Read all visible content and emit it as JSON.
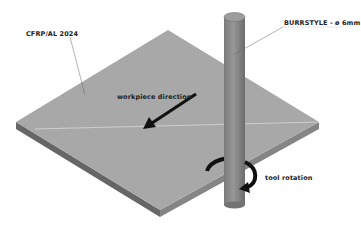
{
  "labels": {
    "material": "CFRP/AL 2024",
    "tool": "BURRSTYLE - ø 6mm",
    "workpiece_direction": "workpiece direction",
    "tool_rotation": "tool rotation"
  },
  "colors": {
    "plate_top": "#a9a9a9",
    "plate_side_left": "#6e6e6e",
    "plate_side_right": "#8a8a8a",
    "tool_body": "#8c8c8c",
    "tool_top": "#9e9e9e",
    "arrow": "#111111",
    "leader_line": "#555555"
  }
}
